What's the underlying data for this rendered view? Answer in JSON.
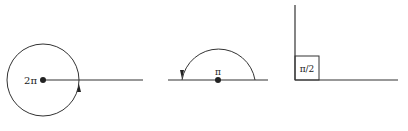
{
  "diagram": {
    "figures": [
      {
        "id": "full-rotation",
        "label": "2π",
        "description": "Full circle rotation with arrow"
      },
      {
        "id": "straight-angle",
        "label": "π",
        "description": "Semicircle rotation with arrow"
      },
      {
        "id": "right-angle",
        "label": "π/2",
        "description": "Right angle with square marker"
      }
    ]
  },
  "colors": {
    "stroke": "#333333",
    "background": "#ffffff"
  }
}
